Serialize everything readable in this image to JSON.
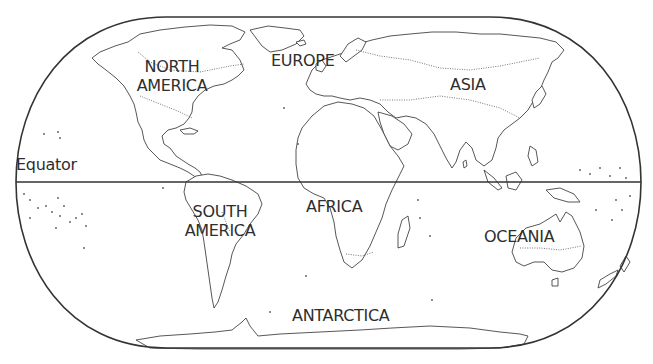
{
  "map": {
    "title": "World continents outline map",
    "labels": {
      "equator": "Equator",
      "north_america_1": "NORTH",
      "north_america_2": "AMERICA",
      "europe": "EUROPE",
      "asia": "ASIA",
      "south_america_1": "SOUTH",
      "south_america_2": "AMERICA",
      "africa": "AFRICA",
      "oceania": "OCEANIA",
      "antarctica": "ANTARCTICA"
    },
    "colors": {
      "background": "#ffffff",
      "outline": "#333333",
      "text": "#2e2e2e"
    }
  }
}
